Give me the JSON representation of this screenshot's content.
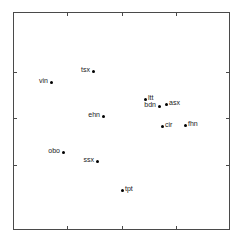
{
  "chart_data": {
    "type": "scatter",
    "title": "",
    "subtitle": "",
    "xlabel": "",
    "ylabel": "",
    "grid": false,
    "legend": "none",
    "axis": {
      "frame": {
        "left": 13,
        "top": 12,
        "right": 230,
        "bottom": 230
      },
      "x_tick_pixels": [
        67,
        122,
        176
      ],
      "y_tick_pixels": [
        72,
        118,
        165
      ],
      "x_tick_labels": [],
      "y_tick_labels": [],
      "tick_sides": [
        "left",
        "right",
        "top",
        "bottom"
      ]
    },
    "points": [
      {
        "label": "tsx",
        "px": 93,
        "py": 71,
        "label_side": "left"
      },
      {
        "label": "vin",
        "px": 51,
        "py": 82,
        "label_side": "left"
      },
      {
        "label": "ltt",
        "px": 145,
        "py": 99,
        "label_side": "right"
      },
      {
        "label": "bdn",
        "px": 159,
        "py": 106,
        "label_side": "left"
      },
      {
        "label": "asx",
        "px": 166,
        "py": 104,
        "label_side": "right"
      },
      {
        "label": "ehn",
        "px": 103,
        "py": 116,
        "label_side": "left"
      },
      {
        "label": "cir",
        "px": 162,
        "py": 126,
        "label_side": "right"
      },
      {
        "label": "fhn",
        "px": 185,
        "py": 125,
        "label_side": "right"
      },
      {
        "label": "obo",
        "px": 63,
        "py": 152,
        "label_side": "left"
      },
      {
        "label": "ssx",
        "px": 97,
        "py": 161,
        "label_side": "left"
      },
      {
        "label": "tpt",
        "px": 122,
        "py": 190,
        "label_side": "right"
      }
    ],
    "point_count": 11,
    "marker": {
      "shape": "circle",
      "color": "#000000",
      "size_px": 3
    },
    "frame_color": "#4a4a4a",
    "background_color": "#ffffff"
  }
}
